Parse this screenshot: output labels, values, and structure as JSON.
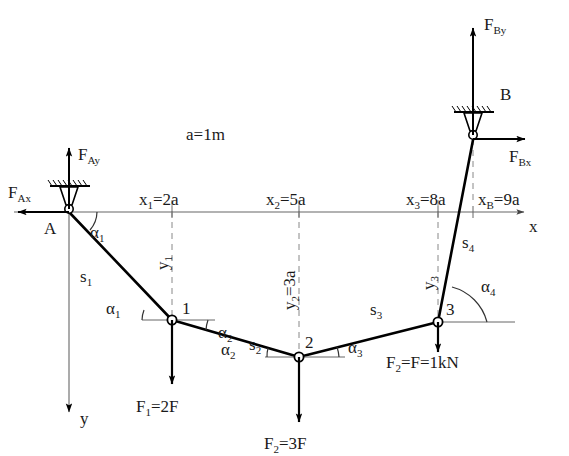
{
  "diagram": {
    "scale_note": "a=1m",
    "colors": {
      "member": "#000000",
      "axis": "#555555",
      "dashed": "#777777",
      "force": "#000000",
      "background": "#ffffff"
    }
  },
  "axes": {
    "x_label": "x",
    "y_label": "y"
  },
  "supports": [
    {
      "name": "A",
      "label": "A",
      "type": "pin"
    },
    {
      "name": "B",
      "label": "B",
      "type": "pin"
    }
  ],
  "reactions": [
    {
      "name": "F_Ax",
      "base": "F",
      "sub": "Ax",
      "direction": "left"
    },
    {
      "name": "F_Ay",
      "base": "F",
      "sub": "Ay",
      "direction": "up"
    },
    {
      "name": "F_Bx",
      "base": "F",
      "sub": "Bx",
      "direction": "right"
    },
    {
      "name": "F_By",
      "base": "F",
      "sub": "By",
      "direction": "up"
    }
  ],
  "nodes": [
    {
      "label": "1"
    },
    {
      "label": "2"
    },
    {
      "label": "3"
    }
  ],
  "members": [
    {
      "base": "s",
      "sub": "1"
    },
    {
      "base": "s",
      "sub": "2"
    },
    {
      "base": "s",
      "sub": "3"
    },
    {
      "base": "s",
      "sub": "4"
    }
  ],
  "angles": [
    {
      "base": "α",
      "sub": "1",
      "at": "A"
    },
    {
      "base": "α",
      "sub": "1",
      "at": "node-1"
    },
    {
      "base": "α",
      "sub": "2",
      "at": "node-1"
    },
    {
      "base": "α",
      "sub": "2",
      "at": "node-2"
    },
    {
      "base": "α",
      "sub": "3",
      "at": "node-2"
    },
    {
      "base": "α",
      "sub": "4",
      "at": "node-3"
    }
  ],
  "coordinates": {
    "x": [
      {
        "base": "x",
        "sub": "1",
        "value": "=2a"
      },
      {
        "base": "x",
        "sub": "2",
        "value": "=5a"
      },
      {
        "base": "x",
        "sub": "3",
        "value": "=8a"
      },
      {
        "base": "x",
        "sub": "B",
        "value": "=9a"
      }
    ],
    "y": [
      {
        "base": "y",
        "sub": "1",
        "value": ""
      },
      {
        "base": "y",
        "sub": "2",
        "value": "=3a"
      },
      {
        "base": "y",
        "sub": "3",
        "value": ""
      }
    ]
  },
  "loads": [
    {
      "base": "F",
      "sub": "1",
      "value": "=2F",
      "direction": "down",
      "at": "node-1"
    },
    {
      "base": "F",
      "sub": "2",
      "value": "=3F",
      "direction": "down",
      "at": "node-2"
    },
    {
      "base": "F",
      "sub": "2",
      "value": "=F=1kN",
      "direction": "down",
      "at": "node-3"
    }
  ]
}
